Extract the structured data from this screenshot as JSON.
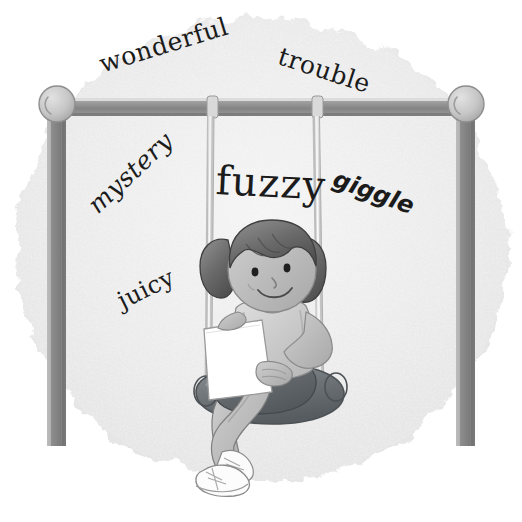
{
  "illustration": {
    "title": "Girl reading on a swing with floating words",
    "scene_description": "A cartoon girl with pigtails sits on a rope swing reading a sheet of paper, surrounded by scattered hand-set words on a textured gray background blob.",
    "background_color": "#ffffff",
    "blob_color": "#ededed",
    "ink_color": "#1b1b1b"
  },
  "words": [
    {
      "id": "wonderful",
      "text": "wonderful",
      "style": "serif-typewriter",
      "rotation_deg": -17,
      "x": 100,
      "y": 52,
      "font_size": 25
    },
    {
      "id": "trouble",
      "text": "trouble",
      "style": "serif-typewriter",
      "rotation_deg": 18,
      "x": 279,
      "y": 43,
      "font_size": 25
    },
    {
      "id": "mystery",
      "text": "mystery",
      "style": "serif-italic",
      "rotation_deg": -43,
      "x": 92,
      "y": 196,
      "font_size": 25
    },
    {
      "id": "fuzzy",
      "text": "fuzzy",
      "style": "serif-display",
      "rotation_deg": 3,
      "x": 216,
      "y": 160,
      "font_size": 40
    },
    {
      "id": "giggle",
      "text": "giggle",
      "style": "sans-bold-italic",
      "rotation_deg": 20,
      "x": 334,
      "y": 166,
      "font_size": 24
    },
    {
      "id": "juicy",
      "text": "juicy",
      "style": "serif",
      "rotation_deg": -26,
      "x": 119,
      "y": 290,
      "font_size": 24
    }
  ],
  "swing_set": {
    "frame_color": "#8a8a8a",
    "frame_shadow_color": "#6e6e6e",
    "frame_highlight_color": "#c9c9c9",
    "cap_color": "#c2c2c2",
    "rope_color": "#d8d8d8",
    "seat_color": "#6f7478",
    "parts": [
      "left-post",
      "right-post",
      "crossbar",
      "left-cap",
      "right-cap",
      "left-rope",
      "right-rope",
      "seat"
    ]
  },
  "girl": {
    "hair_color": "#6b6b6b",
    "hair_shadow_color": "#4f4f4f",
    "skin_color": "#bdbdbd",
    "skin_shadow_color": "#9d9d9d",
    "shirt_color": "#cfcfcf",
    "shorts_color": "#606568",
    "shoe_color": "#fbfbfb",
    "paper_color": "#ffffff",
    "features": [
      "pigtails",
      "bangs",
      "eyes",
      "nose",
      "smile",
      "paper",
      "crossed-legs",
      "sneakers"
    ]
  }
}
